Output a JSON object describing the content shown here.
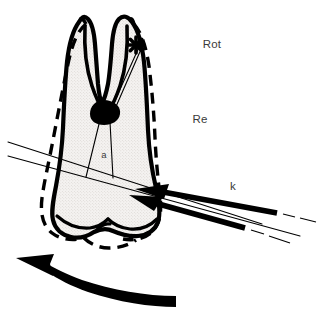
{
  "figure": {
    "background_color": "#ffffff",
    "ink_color": "#000000",
    "fill_color": "#f0eeec",
    "stipple_color": "#c9c5c2",
    "label_color": "#3a3a3a"
  },
  "labels": {
    "rotation": "Rot",
    "resistance": "Re",
    "force": "k",
    "distance": "a"
  },
  "markers": {
    "rotation_center_icon": "asterisk-marker",
    "furcation_icon": "furcation-blob"
  },
  "annotations": {
    "tooth_outline_solid": "original tooth position",
    "tooth_outline_dashed": "displaced tooth position",
    "force_couple": "two parallel force vectors pointing left",
    "rotation_arrow": "curved arrow indicating rotation direction"
  }
}
